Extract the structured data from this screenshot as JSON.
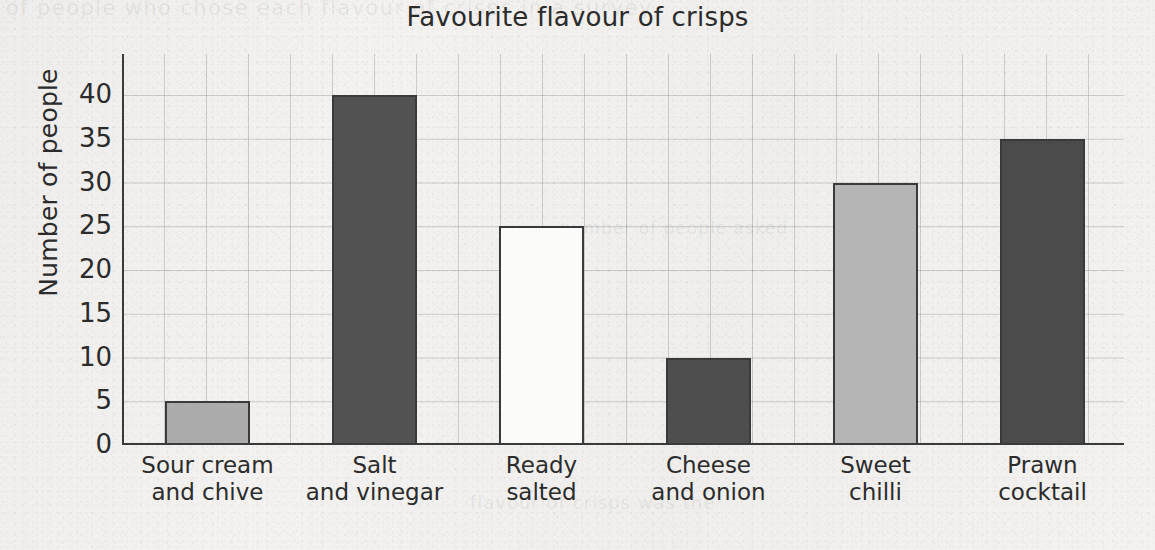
{
  "page": {
    "ghost_text_top": "of people who chose each flavour of crisps in a survey,",
    "ghost_text_middle": "number of people asked",
    "ghost_text_bottom": "flavour of crisps was the",
    "background_color": "#f3f2f0",
    "ink_color": "#2b2b2b"
  },
  "chart_data": {
    "type": "bar",
    "title": "Favourite flavour of crisps",
    "xlabel": "",
    "ylabel": "Number of people",
    "ylim": [
      0,
      44.7
    ],
    "yticks": [
      0,
      5,
      10,
      15,
      20,
      25,
      30,
      35,
      40
    ],
    "ytick_labels": [
      "0",
      "5",
      "10",
      "15",
      "20",
      "25",
      "30",
      "35",
      "40"
    ],
    "grid": true,
    "legend": "none",
    "categories": [
      "Sour cream and chive",
      "Salt and vinegar",
      "Ready salted",
      "Cheese and onion",
      "Sweet chilli",
      "Prawn cocktail"
    ],
    "category_lines": [
      [
        "Sour cream",
        "and chive"
      ],
      [
        "Salt",
        "and vinegar"
      ],
      [
        "Ready",
        "salted"
      ],
      [
        "Cheese",
        "and onion"
      ],
      [
        "Sweet",
        "chilli"
      ],
      [
        "Prawn",
        "cocktail"
      ]
    ],
    "values": [
      5,
      40,
      25,
      10,
      30,
      35
    ],
    "bar_colors": [
      "#ababab",
      "#525252",
      "#fbfbfa",
      "#4e4e4e",
      "#b5b5b5",
      "#4b4b4b"
    ],
    "bar_edge_color": "#3a3a3a"
  }
}
